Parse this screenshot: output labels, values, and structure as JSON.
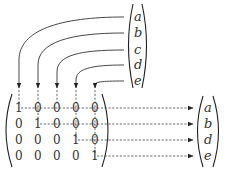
{
  "top_vector": {
    "entries": [
      "a",
      "b",
      "c",
      "d",
      "e"
    ]
  },
  "matrix": {
    "rows": [
      [
        "1",
        "0",
        "0",
        "0",
        "0"
      ],
      [
        "0",
        "1",
        "0",
        "0",
        "0"
      ],
      [
        "0",
        "0",
        "0",
        "1",
        "0"
      ],
      [
        "0",
        "0",
        "0",
        "0",
        "1"
      ]
    ]
  },
  "result_vector": {
    "entries": [
      "a",
      "b",
      "d",
      "e"
    ]
  },
  "colors": {
    "stroke": "#333333",
    "background": "#ffffff"
  }
}
